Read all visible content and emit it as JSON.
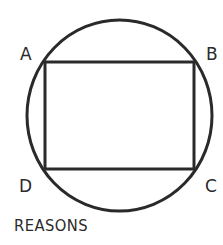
{
  "diagram": {
    "vertices": [
      {
        "label": "A",
        "position": "top-left"
      },
      {
        "label": "B",
        "position": "top-right"
      },
      {
        "label": "C",
        "position": "bottom-right"
      },
      {
        "label": "D",
        "position": "bottom-left"
      }
    ],
    "shapes": [
      "circle",
      "rectangle ABCD inscribed in circle"
    ],
    "caption": "REASONS",
    "stroke_color": "#2a2a2a"
  }
}
